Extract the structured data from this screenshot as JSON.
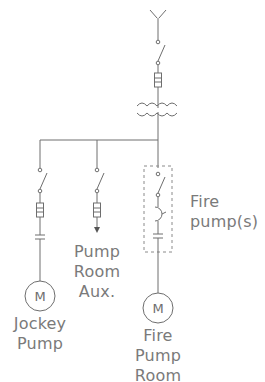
{
  "diagram": {
    "colors": {
      "line": "#6e6e6e",
      "text": "#7a7a7a",
      "background": "#ffffff"
    },
    "source": {
      "symbol": "utility-service-icon"
    },
    "main_feed": [
      "disconnect-switch",
      "fuse",
      "transformer"
    ],
    "branches": [
      {
        "id": "jockey",
        "components": [
          "disconnect-switch",
          "fuse",
          "contactor",
          "motor"
        ],
        "motor_label": "M",
        "label_lines": [
          "Jockey",
          "Pump"
        ]
      },
      {
        "id": "aux",
        "components": [
          "disconnect-switch",
          "fuse",
          "arrow"
        ],
        "label_lines": [
          "Pump",
          "Room",
          "Aux."
        ]
      },
      {
        "id": "fire",
        "components": [
          "disconnect-switch",
          "circuit-breaker",
          "contactor",
          "motor"
        ],
        "motor_label": "M",
        "label_lines": [
          "Fire",
          "Pump",
          "Room"
        ],
        "enclosure_label_lines": [
          "Fire",
          "pump(s)"
        ]
      }
    ]
  }
}
